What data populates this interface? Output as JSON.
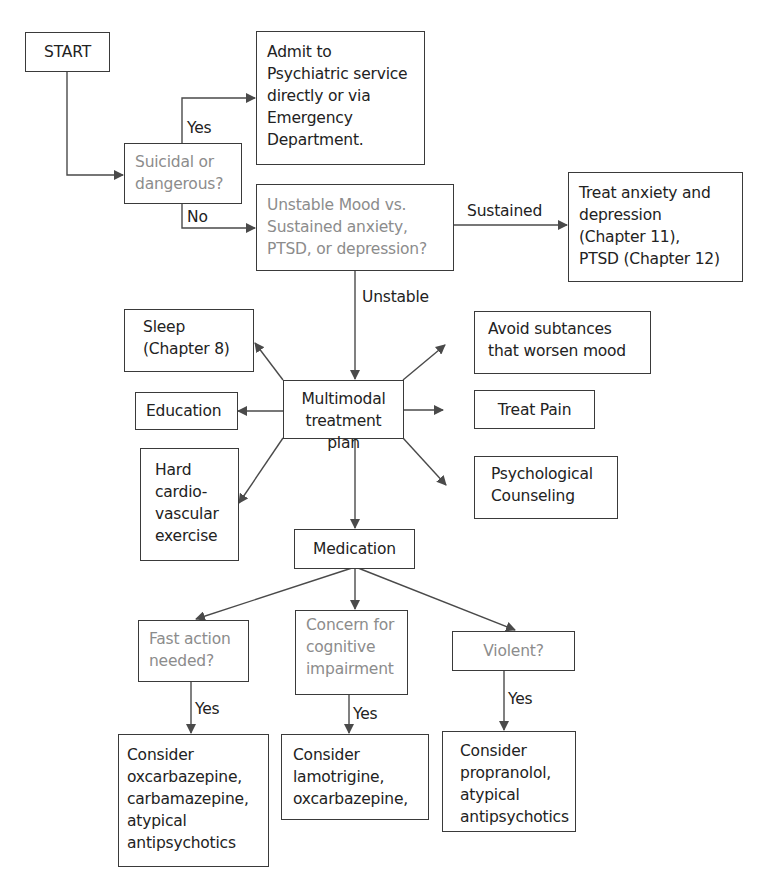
{
  "diagram": {
    "type": "flowchart",
    "colors": {
      "line": "#4a4a4a",
      "text": "#222222",
      "question_text": "#8c8c8c",
      "background": "#ffffff"
    },
    "nodes": {
      "start": "START",
      "admit": "Admit to\nPsychiatric service\ndirectly or via\nEmergency\nDepartment.",
      "suicidal": "Suicidal or\ndangerous?",
      "unstable_vs_sustained": "Unstable Mood vs.\nSustained anxiety,\nPTSD, or depression?",
      "treat_anxiety": "Treat anxiety and\ndepression\n(Chapter 11),\nPTSD (Chapter 12)",
      "sleep": "Sleep\n(Chapter 8)",
      "education": "Education",
      "exercise": "Hard\ncardio-\nvascular\nexercise",
      "multimodal": "Multimodal\ntreatment plan",
      "avoid_substances": "Avoid subtances\nthat worsen mood",
      "treat_pain": "Treat Pain",
      "counseling": "Psychological\nCounseling",
      "medication": "Medication",
      "fast_action": "Fast action\nneeded?",
      "cognitive": "Concern for\ncognitive\nimpairment",
      "violent": "Violent?",
      "consider_fast": "Consider\noxcarbazepine,\ncarbamazepine,\natypical\nantipsychotics",
      "consider_cognitive": "Consider\nlamotrigine,\noxcarbazepine,",
      "consider_violent": "Consider\npropranolol,\natypical\nantipsychotics"
    },
    "edge_labels": {
      "suicidal_yes": "Yes",
      "suicidal_no": "No",
      "sustained": "Sustained",
      "unstable": "Unstable",
      "fast_yes": "Yes",
      "cognitive_yes": "Yes",
      "violent_yes": "Yes"
    },
    "edges": [
      [
        "start",
        "suicidal"
      ],
      [
        "suicidal",
        "admit",
        "Yes"
      ],
      [
        "suicidal",
        "unstable_vs_sustained",
        "No"
      ],
      [
        "unstable_vs_sustained",
        "treat_anxiety",
        "Sustained"
      ],
      [
        "unstable_vs_sustained",
        "multimodal",
        "Unstable"
      ],
      [
        "multimodal",
        "sleep"
      ],
      [
        "multimodal",
        "education"
      ],
      [
        "multimodal",
        "exercise"
      ],
      [
        "multimodal",
        "avoid_substances"
      ],
      [
        "multimodal",
        "treat_pain"
      ],
      [
        "multimodal",
        "counseling"
      ],
      [
        "multimodal",
        "medication"
      ],
      [
        "medication",
        "fast_action"
      ],
      [
        "medication",
        "cognitive"
      ],
      [
        "medication",
        "violent"
      ],
      [
        "fast_action",
        "consider_fast",
        "Yes"
      ],
      [
        "cognitive",
        "consider_cognitive",
        "Yes"
      ],
      [
        "violent",
        "consider_violent",
        "Yes"
      ]
    ]
  }
}
